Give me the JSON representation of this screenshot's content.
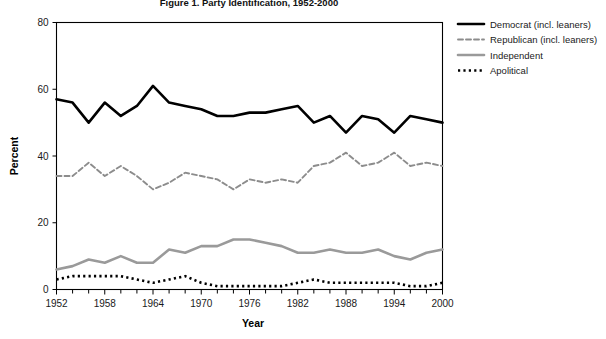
{
  "chart_data": {
    "type": "line",
    "title": "Figure 1. Party Identification, 1952-2000",
    "xlabel": "Year",
    "ylabel": "Percent",
    "ylim": [
      0,
      80
    ],
    "xlim": [
      1952,
      2000
    ],
    "ytick_labels": [
      "0",
      "20",
      "40",
      "60",
      "80"
    ],
    "ytick_values": [
      0,
      20,
      40,
      60,
      80
    ],
    "xtick_labels": [
      "1952",
      "1958",
      "1964",
      "1970",
      "1976",
      "1982",
      "1988",
      "1994",
      "2000"
    ],
    "xtick_values": [
      1952,
      1958,
      1964,
      1970,
      1976,
      1982,
      1988,
      1994,
      2000
    ],
    "xtick_minor_step": 2,
    "grid": false,
    "legend_position": "right",
    "x": [
      1952,
      1954,
      1956,
      1958,
      1960,
      1962,
      1964,
      1966,
      1968,
      1970,
      1972,
      1974,
      1976,
      1978,
      1980,
      1982,
      1984,
      1986,
      1988,
      1990,
      1992,
      1994,
      1996,
      1998,
      2000
    ],
    "series": [
      {
        "name": "Democrat (incl. leaners)",
        "color": "#000000",
        "style": "solid",
        "values": [
          57,
          56,
          50,
          56,
          52,
          55,
          61,
          56,
          55,
          54,
          52,
          52,
          53,
          53,
          54,
          55,
          50,
          52,
          47,
          52,
          51,
          47,
          52,
          51,
          50
        ]
      },
      {
        "name": "Republican (incl. leaners)",
        "color": "#8c8c8c",
        "style": "dashed",
        "values": [
          34,
          34,
          38,
          34,
          37,
          34,
          30,
          32,
          35,
          34,
          33,
          30,
          33,
          32,
          33,
          32,
          37,
          38,
          41,
          37,
          38,
          41,
          37,
          38,
          37
        ]
      },
      {
        "name": "Independent",
        "color": "#9a9a9a",
        "style": "solid",
        "values": [
          6,
          7,
          9,
          8,
          10,
          8,
          8,
          12,
          11,
          13,
          13,
          15,
          15,
          14,
          13,
          11,
          11,
          12,
          11,
          11,
          12,
          10,
          9,
          11,
          12
        ]
      },
      {
        "name": "Apolitical",
        "color": "#000000",
        "style": "dotted",
        "values": [
          3,
          4,
          4,
          4,
          4,
          3,
          2,
          3,
          4,
          2,
          1,
          1,
          1,
          1,
          1,
          2,
          3,
          2,
          2,
          2,
          2,
          2,
          1,
          1,
          2
        ]
      }
    ]
  }
}
